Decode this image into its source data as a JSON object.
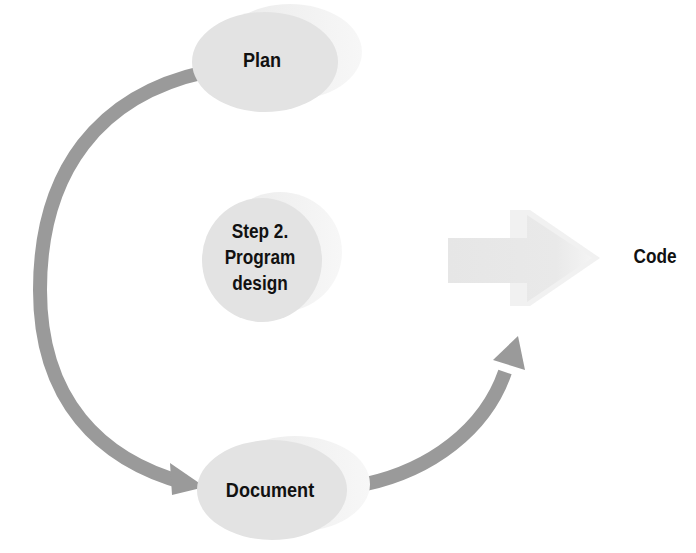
{
  "diagram": {
    "type": "cycle-flow",
    "nodes": [
      {
        "id": "plan",
        "label": "Plan"
      },
      {
        "id": "program-design",
        "label_lines": [
          "Step 2.",
          "Program",
          "design"
        ]
      },
      {
        "id": "document",
        "label": "Document"
      },
      {
        "id": "code",
        "label": "Code"
      }
    ],
    "edges": [
      {
        "from": "plan",
        "to": "document",
        "style": "curved-arrow"
      },
      {
        "from": "document",
        "to": "code",
        "style": "curved-arrow"
      },
      {
        "from": "program-design",
        "to": "code",
        "style": "block-arrow"
      }
    ],
    "colors": {
      "ellipse_fill": "#e4e4e4",
      "ellipse_shadow": "#efefef",
      "curved_arrow": "#9a9a9a",
      "block_arrow": "#e8e8e8",
      "text": "#111111"
    }
  }
}
